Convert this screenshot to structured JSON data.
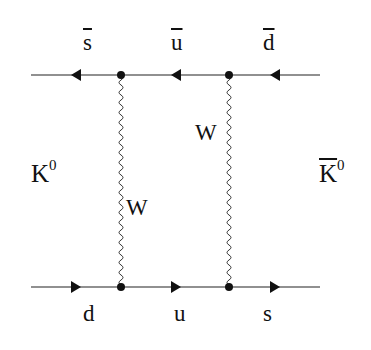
{
  "diagram": {
    "type": "feynman-box-diagram",
    "top_line": {
      "labels": [
        "s",
        "u",
        "d"
      ],
      "antiquark": true,
      "arrow_direction": "left"
    },
    "bottom_line": {
      "labels": [
        "d",
        "u",
        "s"
      ],
      "antiquark": false,
      "arrow_direction": "right"
    },
    "propagators": [
      {
        "label": "W",
        "side": "right"
      },
      {
        "label": "W",
        "side": "left"
      }
    ],
    "initial_state": {
      "label": "K",
      "sup": "0"
    },
    "final_state": {
      "label": "K",
      "sup": "0",
      "bar": true
    },
    "colors": {
      "line": "#1a1a1a",
      "text": "#111111"
    }
  }
}
